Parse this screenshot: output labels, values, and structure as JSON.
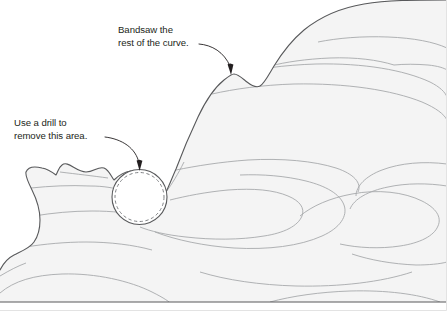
{
  "figure": {
    "canvas": {
      "width": 447,
      "height": 311
    },
    "colors": {
      "background": "#ffffff",
      "wood_fill": "#f4f4f4",
      "wood_outline": "#58595b",
      "grain_line": "#a7a9ac",
      "frame_border": "#e3e3e3",
      "text": "#231f20",
      "leader_line": "#231f20",
      "dashed_circle": "#808285"
    }
  },
  "annotations": [
    {
      "id": "bandsaw-note",
      "lines": [
        "Bandsaw the",
        "rest of the curve."
      ],
      "text_x": 118,
      "text_y": 33,
      "line_height": 12.5,
      "leader": "M 199 44 C 212 45 224 52 230 66",
      "arrow_tip": {
        "x": 231,
        "y": 74
      },
      "arrow_angle": 78
    },
    {
      "id": "drill-note",
      "lines": [
        "Use a drill to",
        "remove this area."
      ],
      "text_x": 14,
      "text_y": 126,
      "line_height": 12.5,
      "leader": "M 105 137 C 122 139 136 148 139 163",
      "arrow_tip": {
        "x": 139.5,
        "y": 170
      },
      "arrow_angle": 80
    }
  ],
  "drill_hole": {
    "id": "drill-circle",
    "center_x": 139.5,
    "center_y": 197,
    "outer_radius": 27.5,
    "inner_radius": 24.5,
    "dash_pattern": "3.2,2.6"
  },
  "labels": {
    "workpiece": "wood-workpiece",
    "grain": "wood-grain-lines",
    "baseline": "board-bottom-edge"
  }
}
